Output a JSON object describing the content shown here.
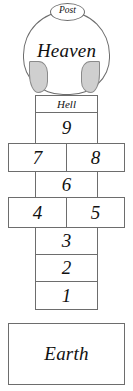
{
  "diagram": {
    "colors": {
      "stroke": "#6d6d6d",
      "fill": "#ffffff",
      "petal_fill": "#cfcfcf",
      "petal_stroke": "#8a8a8a",
      "text": "#111111"
    },
    "top": {
      "post_label": "Post",
      "heaven_label": "Heaven"
    },
    "cells": [
      {
        "label": "Hell",
        "kind": "hell",
        "left": 35,
        "top": 95,
        "width": 63,
        "height": 18
      },
      {
        "label": "9",
        "kind": "num",
        "left": 35,
        "top": 112,
        "width": 63,
        "height": 32
      },
      {
        "label": "7",
        "kind": "num",
        "left": 8,
        "top": 143,
        "width": 59,
        "height": 29
      },
      {
        "label": "8",
        "kind": "num",
        "left": 66,
        "top": 143,
        "width": 59,
        "height": 29
      },
      {
        "label": "6",
        "kind": "num",
        "left": 35,
        "top": 171,
        "width": 63,
        "height": 27
      },
      {
        "label": "4",
        "kind": "num",
        "left": 8,
        "top": 197,
        "width": 59,
        "height": 31
      },
      {
        "label": "5",
        "kind": "num",
        "left": 66,
        "top": 197,
        "width": 59,
        "height": 31
      },
      {
        "label": "3",
        "kind": "num",
        "left": 35,
        "top": 227,
        "width": 63,
        "height": 28
      },
      {
        "label": "2",
        "kind": "num",
        "left": 35,
        "top": 254,
        "width": 63,
        "height": 28
      },
      {
        "label": "1",
        "kind": "num",
        "left": 35,
        "top": 281,
        "width": 63,
        "height": 29
      },
      {
        "label": "Earth",
        "kind": "earth",
        "left": 8,
        "top": 323,
        "width": 117,
        "height": 62
      }
    ]
  }
}
